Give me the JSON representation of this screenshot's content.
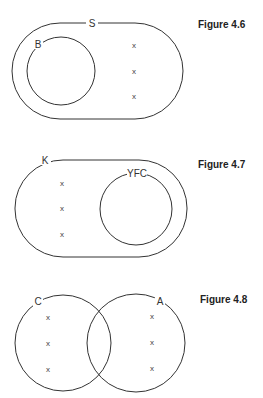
{
  "figures": [
    {
      "caption": "Figure 4.6",
      "outer": {
        "label": "S",
        "shape": "stadium"
      },
      "inner": {
        "label": "B",
        "shape": "circle"
      },
      "marks": [
        "x",
        "x",
        "x"
      ]
    },
    {
      "caption": "Figure 4.7",
      "outer": {
        "label": "K",
        "shape": "stadium"
      },
      "inner": {
        "label": "YFC",
        "shape": "circle"
      },
      "marks": [
        "x",
        "x",
        "x"
      ]
    },
    {
      "caption": "Figure 4.8",
      "left": {
        "label": "C",
        "shape": "circle"
      },
      "right": {
        "label": "A",
        "shape": "circle"
      },
      "left_marks": [
        "x",
        "x",
        "x"
      ],
      "right_marks": [
        "x",
        "x",
        "x"
      ]
    }
  ],
  "colors": {
    "line": "#333333",
    "background": "#ffffff"
  }
}
